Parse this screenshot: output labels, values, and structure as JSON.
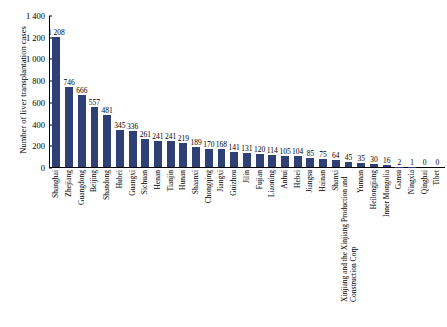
{
  "chart_data": {
    "type": "bar",
    "title": "",
    "xlabel": "",
    "ylabel": "Number of liver transplantation cases",
    "ylim": [
      0,
      1400
    ],
    "ytick_labels": [
      "1 400",
      "1 200",
      "1 000",
      "800",
      "600",
      "400",
      "200",
      "0"
    ],
    "ytick_values": [
      1400,
      1200,
      1000,
      800,
      600,
      400,
      200,
      0
    ],
    "grid": false,
    "legend": null,
    "bar_color": "#2f4074",
    "categories": [
      "Shanghai",
      "Zhejiang",
      "Guangdong",
      "Beijing",
      "Shandong",
      "Hubei",
      "Guangxi",
      "Sichuan",
      "Henan",
      "Tianjin",
      "Hunan",
      "Shaanxi",
      "Chongqing",
      "Jiangxi",
      "Guizhou",
      "Jilin",
      "Fujian",
      "Liaoning",
      "Anhui",
      "Hebei",
      "Jiangsu",
      "Hainan",
      "Shanxi",
      "Xinjiang and the Xinjiang Production and Construction Corp",
      "Yunnan",
      "Heilongjiang",
      "Inner Mongolia",
      "Gansu",
      "Ningxia",
      "Qinghai",
      "Tibet"
    ],
    "values": [
      1208,
      746,
      666,
      557,
      481,
      345,
      336,
      261,
      241,
      241,
      219,
      189,
      170,
      168,
      141,
      131,
      120,
      114,
      105,
      104,
      85,
      75,
      64,
      45,
      35,
      30,
      16,
      2,
      1,
      0,
      0
    ],
    "value_labels": [
      "1 208",
      "746",
      "666",
      "557",
      "481",
      "345",
      "336",
      "261",
      "241",
      "241",
      "219",
      "189",
      "170",
      "168",
      "141",
      "131",
      "120",
      "114",
      "105",
      "104",
      "85",
      "75",
      "64",
      "45",
      "35",
      "30",
      "16",
      "2",
      "1",
      "0",
      "0"
    ]
  }
}
